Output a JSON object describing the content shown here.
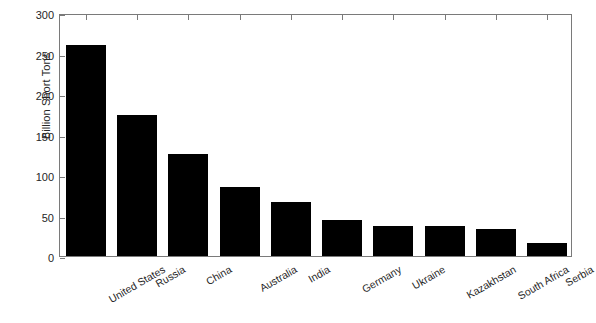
{
  "chart_data": {
    "type": "bar",
    "title": "",
    "xlabel": "",
    "ylabel": "Billion Short Tons",
    "ylim": [
      0,
      300
    ],
    "yticks": [
      0,
      50,
      100,
      150,
      200,
      250,
      300
    ],
    "grid": false,
    "legend": null,
    "bar_color": "#000000",
    "background_color": "#ffffff",
    "axis_color": "#7a7a7a",
    "categories": [
      "United States",
      "Russia",
      "China",
      "Australia",
      "India",
      "Germany",
      "Ukraine",
      "Kazakhstan",
      "South Africa",
      "Serbia"
    ],
    "values": [
      261,
      174,
      126,
      85,
      67,
      45,
      37,
      37,
      33,
      16
    ]
  }
}
